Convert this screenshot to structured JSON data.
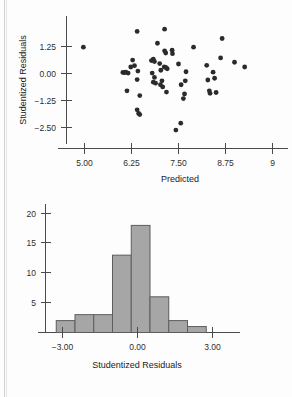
{
  "chart_data": [
    {
      "id": "residuals-vs-predicted",
      "type": "scatter",
      "title": "",
      "xlabel": "Predicted",
      "ylabel": "Studentized Residuals",
      "xlim": [
        4.55,
        9.35
      ],
      "ylim": [
        -3.05,
        2.35
      ],
      "xticks": [
        5.0,
        6.25,
        7.5,
        8.75,
        9.0
      ],
      "xticklabels": [
        "5.00",
        "6.25",
        "7.50",
        "8.75",
        "9"
      ],
      "yticks": [
        1.25,
        0.0,
        -1.25,
        -2.5
      ],
      "yticklabels": [
        "1.25",
        "0.00",
        "−1.25",
        "−2.50"
      ],
      "grid": false,
      "legend": null,
      "marker": "filled-circle",
      "marker_color": "#2b2b2b",
      "points": [
        {
          "x": 4.97,
          "y": 1.22
        },
        {
          "x": 6.02,
          "y": 0.05
        },
        {
          "x": 6.06,
          "y": 0.04
        },
        {
          "x": 6.1,
          "y": 0.06
        },
        {
          "x": 6.16,
          "y": 0.02
        },
        {
          "x": 6.13,
          "y": -0.8
        },
        {
          "x": 6.23,
          "y": 0.3
        },
        {
          "x": 6.28,
          "y": 0.62
        },
        {
          "x": 6.33,
          "y": 0.36
        },
        {
          "x": 6.4,
          "y": 1.95
        },
        {
          "x": 6.42,
          "y": 0.11
        },
        {
          "x": 6.4,
          "y": -0.28
        },
        {
          "x": 6.47,
          "y": -1.02
        },
        {
          "x": 6.4,
          "y": -1.68
        },
        {
          "x": 6.44,
          "y": -1.85
        },
        {
          "x": 6.47,
          "y": -1.9
        },
        {
          "x": 6.78,
          "y": 0.6
        },
        {
          "x": 6.83,
          "y": 0.66
        },
        {
          "x": 6.86,
          "y": 0.55
        },
        {
          "x": 6.8,
          "y": 0.02
        },
        {
          "x": 6.86,
          "y": -0.18
        },
        {
          "x": 6.83,
          "y": -0.4
        },
        {
          "x": 6.89,
          "y": -0.45
        },
        {
          "x": 6.94,
          "y": 1.4
        },
        {
          "x": 7.0,
          "y": 0.46
        },
        {
          "x": 7.03,
          "y": 0.15
        },
        {
          "x": 7.06,
          "y": -0.34
        },
        {
          "x": 7.02,
          "y": -0.52
        },
        {
          "x": 7.08,
          "y": -0.62
        },
        {
          "x": 7.13,
          "y": 2.05
        },
        {
          "x": 7.16,
          "y": 0.28
        },
        {
          "x": 7.13,
          "y": 1.05
        },
        {
          "x": 7.16,
          "y": 0.95
        },
        {
          "x": 7.18,
          "y": -0.86
        },
        {
          "x": 7.12,
          "y": 0.3
        },
        {
          "x": 7.2,
          "y": 0.22
        },
        {
          "x": 7.34,
          "y": 0.92
        },
        {
          "x": 7.33,
          "y": 1.08
        },
        {
          "x": 7.43,
          "y": -2.62
        },
        {
          "x": 7.56,
          "y": -2.3
        },
        {
          "x": 7.5,
          "y": 0.44
        },
        {
          "x": 7.57,
          "y": -0.52
        },
        {
          "x": 7.63,
          "y": -1.16
        },
        {
          "x": 7.7,
          "y": 0.08
        },
        {
          "x": 7.68,
          "y": -0.34
        },
        {
          "x": 7.66,
          "y": -0.95
        },
        {
          "x": 7.9,
          "y": 1.22
        },
        {
          "x": 8.25,
          "y": 0.38
        },
        {
          "x": 8.28,
          "y": -0.3
        },
        {
          "x": 8.32,
          "y": -0.8
        },
        {
          "x": 8.34,
          "y": -0.92
        },
        {
          "x": 8.42,
          "y": 0.06
        },
        {
          "x": 8.46,
          "y": -0.22
        },
        {
          "x": 8.5,
          "y": -0.88
        },
        {
          "x": 8.62,
          "y": 0.72
        },
        {
          "x": 8.66,
          "y": 1.62
        },
        {
          "x": 8.99,
          "y": 0.52
        },
        {
          "x": 9.26,
          "y": 0.3
        }
      ]
    },
    {
      "id": "studentized-residuals-histogram",
      "type": "bar",
      "title": "",
      "xlabel": "Studentized Residuals",
      "ylabel": "",
      "xlim": [
        -3.75,
        3.75
      ],
      "ylim": [
        0,
        21
      ],
      "xticks": [
        -3.0,
        0.0,
        3.0
      ],
      "xticklabels": [
        "−3.00",
        "0.00",
        "3.00"
      ],
      "yticks": [
        5,
        10,
        15,
        20
      ],
      "yticklabels": [
        "5",
        "10",
        "15",
        "20"
      ],
      "grid": false,
      "legend": null,
      "bar_color": "#a6a6a6",
      "bar_edge_color": "#5d5d5d",
      "bin_edges": [
        -3.25,
        -2.5,
        -1.75,
        -1.0,
        -0.25,
        0.5,
        1.25,
        2.0,
        2.75
      ],
      "categories": [
        "-3.25 to -2.50",
        "-2.50 to -1.75",
        "-1.75 to -1.00",
        "-1.00 to -0.25",
        "-0.25 to 0.50",
        "0.50 to 1.25",
        "1.25 to 2.00",
        "2.00 to 2.75"
      ],
      "values": [
        2,
        3,
        3,
        13,
        18,
        6,
        2,
        1
      ]
    }
  ],
  "scatter": {
    "xlabel": "Predicted",
    "ylabel": "Studentized Residuals",
    "xticklabels": [
      "5.00",
      "6.25",
      "7.50",
      "8.75",
      "9"
    ],
    "yticklabels": [
      "1.25",
      "0.00",
      "−1.25",
      "−2.50"
    ]
  },
  "histogram": {
    "xlabel": "Studentized Residuals",
    "xticklabels": [
      "−3.00",
      "0.00",
      "3.00"
    ],
    "yticklabels": [
      "20",
      "15",
      "10",
      "5"
    ]
  }
}
